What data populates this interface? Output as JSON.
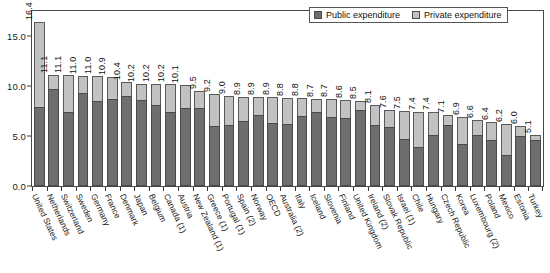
{
  "legend": {
    "public_label": "Public expenditure",
    "private_label": "Private expenditure",
    "public_color": "#6e6e6e",
    "private_color": "#c2c2c2",
    "position": "top-right"
  },
  "chart_data": {
    "type": "bar",
    "subtype": "stacked-vertical",
    "title": "",
    "subtitle": "",
    "xlabel": "",
    "ylabel": "",
    "ylim": [
      0,
      17.5
    ],
    "yticks": [
      "0.0",
      "5.0",
      "10.0",
      "15.0"
    ],
    "ytick_values": [
      0,
      5,
      10,
      15
    ],
    "grid": false,
    "categories": [
      "United States",
      "Netherlands",
      "Switzerland",
      "Sweden",
      "Germany",
      "France",
      "Denmark",
      "Japan",
      "Belgium",
      "Canada (1)",
      "Austria",
      "New Zealand (1)",
      "Greece (1)",
      "Portugal (1)",
      "Spain (2)",
      "Norway",
      "OECD",
      "Australia (2)",
      "Italy",
      "Iceland",
      "Slovenia",
      "Finland",
      "United Kingdom",
      "Ireland (2)",
      "Slovak Republic",
      "Israel (1)",
      "Chile",
      "Hungary",
      "Czech Republic",
      "Korea",
      "Luxembourg (2)",
      "Poland",
      "Mexico",
      "Estonia",
      "Turkey"
    ],
    "totals": [
      16.4,
      11.1,
      11.1,
      11.0,
      11.0,
      10.9,
      10.4,
      10.2,
      10.2,
      10.2,
      10.1,
      9.5,
      9.2,
      9.0,
      8.9,
      8.9,
      8.9,
      8.8,
      8.8,
      8.7,
      8.7,
      8.6,
      8.5,
      8.1,
      7.6,
      7.5,
      7.4,
      7.4,
      7.1,
      6.9,
      6.6,
      6.4,
      6.2,
      6.0,
      5.1
    ],
    "series": [
      {
        "name": "Public expenditure",
        "color": "#6e6e6e",
        "values": [
          7.9,
          9.7,
          7.4,
          9.3,
          8.5,
          8.7,
          9.0,
          8.6,
          8.1,
          7.4,
          7.8,
          7.8,
          6.0,
          6.1,
          6.5,
          7.1,
          6.3,
          6.2,
          7.0,
          7.4,
          6.9,
          6.8,
          7.6,
          6.1,
          5.9,
          4.7,
          3.9,
          5.1,
          6.1,
          4.2,
          5.1,
          4.6,
          3.1,
          5.0,
          4.6
        ]
      },
      {
        "name": "Private expenditure",
        "color": "#c2c2c2",
        "values": [
          8.5,
          1.4,
          3.7,
          1.7,
          2.5,
          2.2,
          1.4,
          1.6,
          2.1,
          2.8,
          2.3,
          1.7,
          3.2,
          2.9,
          2.4,
          1.8,
          2.6,
          2.6,
          1.8,
          1.3,
          1.8,
          1.8,
          0.9,
          2.0,
          1.7,
          2.8,
          3.5,
          2.3,
          1.0,
          2.7,
          1.5,
          1.8,
          3.1,
          1.0,
          0.5
        ]
      }
    ],
    "value_labels": [
      "16.4",
      "11.1",
      "11.1",
      "11.0",
      "11.0",
      "10.9",
      "10.4",
      "10.2",
      "10.2",
      "10.2",
      "10.1",
      "9.5",
      "9.2",
      "9.0",
      "8.9",
      "8.9",
      "8.9",
      "8.8",
      "8.8",
      "8.7",
      "8.7",
      "8.6",
      "8.5",
      "8.1",
      "7.6",
      "7.5",
      "7.4",
      "7.4",
      "7.1",
      "6.9",
      "6.6",
      "6.4",
      "6.2",
      "6.0",
      "5.1"
    ]
  }
}
